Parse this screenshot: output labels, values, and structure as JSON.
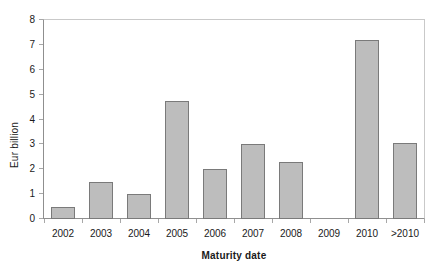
{
  "chart_data": {
    "type": "bar",
    "title": "",
    "xlabel": "Maturity date",
    "ylabel": "Eur billion",
    "categories": [
      "2002",
      "2003",
      "2004",
      "2005",
      "2006",
      "2007",
      "2008",
      "2009",
      "2010",
      ">2010"
    ],
    "values": [
      0.5,
      1.5,
      1.0,
      4.75,
      2.0,
      3.0,
      2.3,
      0,
      7.2,
      3.05
    ],
    "ylim": [
      0,
      8
    ],
    "yticks": [
      "8",
      "7",
      "6",
      "5",
      "4",
      "3",
      "2",
      "1",
      "0"
    ],
    "ytick_values": [
      8,
      7,
      6,
      5,
      4,
      3,
      2,
      1,
      0
    ],
    "grid": false,
    "legend": "none",
    "bar_fill_color": "#bdbdbd",
    "bar_border_color": "#7a7a7a",
    "axis_color": "#8f8f8f",
    "frame_color": "#c9c9c9",
    "background_color": "#ffffff"
  }
}
